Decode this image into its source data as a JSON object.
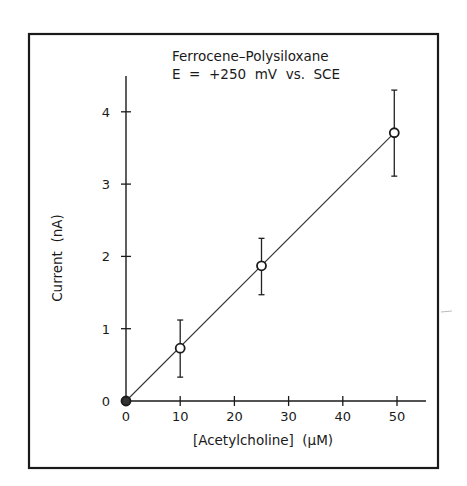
{
  "figure": {
    "title_line1": "Ferrocene–Polysiloxane",
    "title_line2": "E  =  +250  mV  vs.  SCE",
    "xlabel": "[Acetylcholine]  (μM)",
    "ylabel": "Current  (nA)"
  },
  "chart_data": {
    "type": "scatter",
    "xlabel": "[Acetylcholine] (μM)",
    "ylabel": "Current (nA)",
    "xlim": [
      0,
      55
    ],
    "ylim": [
      0,
      4.5
    ],
    "x_ticks": [
      0,
      10,
      20,
      30,
      40,
      50
    ],
    "y_ticks": [
      0,
      1,
      2,
      3,
      4
    ],
    "grid": false,
    "legend": null,
    "series": [
      {
        "name": "Measured current",
        "marker": "open-circle",
        "x": [
          0,
          10,
          25,
          49.5
        ],
        "y": [
          0,
          0.73,
          1.87,
          3.71
        ],
        "error_low": [
          0,
          0.33,
          1.47,
          3.11
        ],
        "error_high": [
          0,
          1.12,
          2.25,
          4.3
        ]
      },
      {
        "name": "Linear fit",
        "type": "line",
        "x": [
          0,
          49.5
        ],
        "y": [
          0,
          3.71
        ]
      }
    ]
  }
}
